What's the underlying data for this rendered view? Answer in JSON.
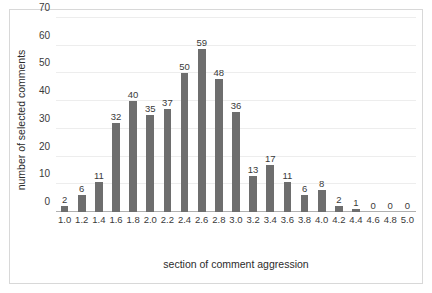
{
  "chart_data": {
    "type": "bar",
    "title": "",
    "xlabel": "section of comment aggression",
    "ylabel": "number of selected comments",
    "categories": [
      "1.0",
      "1.2",
      "1.4",
      "1.6",
      "1.8",
      "2.0",
      "2.2",
      "2.4",
      "2.6",
      "2.8",
      "3.0",
      "3.2",
      "3.4",
      "3.6",
      "3.8",
      "4.0",
      "4.2",
      "4.4",
      "4.6",
      "4.8",
      "5.0"
    ],
    "values": [
      2,
      6,
      11,
      32,
      40,
      35,
      37,
      50,
      59,
      48,
      36,
      13,
      17,
      11,
      6,
      8,
      2,
      1,
      0,
      0,
      0
    ],
    "ylim": [
      0,
      70
    ],
    "yticks": [
      0,
      10,
      20,
      30,
      40,
      50,
      60,
      70
    ],
    "grid": true,
    "legend": false,
    "data_labels": true,
    "bar_color": "#6e6e6e",
    "gridline_color": "#ededed",
    "axis_color": "#b0b0b0",
    "frame_color": "#d8d8d8",
    "background": "#ffffff"
  }
}
